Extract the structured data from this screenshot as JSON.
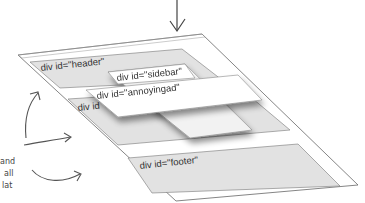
{
  "diagram": {
    "divs": [
      {
        "id": "header",
        "label": "div id=\"header\""
      },
      {
        "id": "sidebar",
        "label": "div id=\"sidebar\""
      },
      {
        "id": "annoyingad",
        "label": "div id=\"annoyingad\""
      },
      {
        "id": "main",
        "label": "div id"
      },
      {
        "id": "footer",
        "label": "div id=\"footer\""
      }
    ],
    "annotation": {
      "lines": [
        "and",
        "all",
        "lat"
      ]
    }
  }
}
